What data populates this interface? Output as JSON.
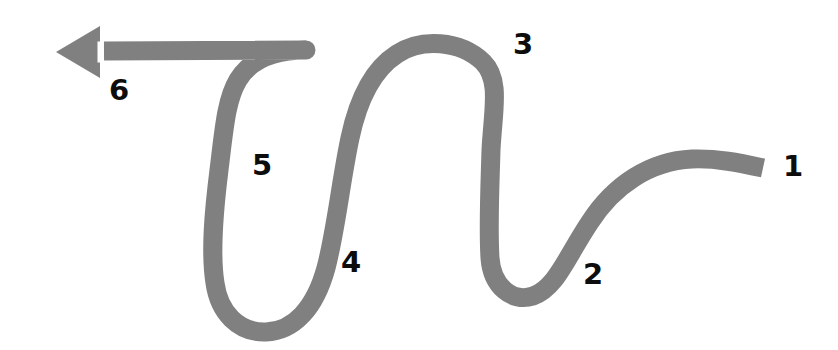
{
  "figure": {
    "kind": "serpentine-process-arrow-diagram",
    "background_color": "#ffffff",
    "width": 838,
    "height": 350
  },
  "arrow": {
    "name": "serpentine-arrow",
    "stroke_color": "#808080",
    "stroke_width": 19,
    "direction": "right-to-left",
    "head": {
      "name": "arrow-head",
      "shape": "triangle",
      "points_toward": "left",
      "tip_x": 56,
      "tip_y": 52,
      "base_x": 100,
      "half_height": 26,
      "gap_color": "#ffffff"
    },
    "path": "M 763 168 C 740 163 716 158 692 159 C 650 161 614 185 590 222 C 566 258 556 288 533 296 C 512 303 492 286 490 258 C 488 226 490 186 491 150 C 493 110 501 80 483 62 C 460 40 421 38 397 54 C 372 70 358 100 350 138 C 341 180 336 230 326 268 C 315 308 294 331 266 332 C 238 333 219 312 215 283 C 210 252 214 210 219 170 C 224 130 226 100 238 80 C 252 57 278 50 306 50 L 104 51"
  },
  "labels": [
    {
      "name": "step-label-1",
      "text": "1",
      "x": 783,
      "y": 152
    },
    {
      "name": "step-label-2",
      "text": "2",
      "x": 583,
      "y": 260
    },
    {
      "name": "step-label-3",
      "text": "3",
      "x": 513,
      "y": 30
    },
    {
      "name": "step-label-4",
      "text": "4",
      "x": 341,
      "y": 248
    },
    {
      "name": "step-label-5",
      "text": "5",
      "x": 252,
      "y": 151
    },
    {
      "name": "step-label-6",
      "text": "6",
      "x": 109,
      "y": 76
    }
  ]
}
